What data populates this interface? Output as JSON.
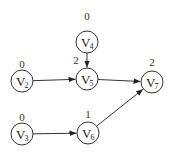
{
  "diagram": {
    "type": "directed-graph",
    "nodes": [
      {
        "id": "V2",
        "letter": "V",
        "sub": "2",
        "value": "0",
        "cx": 22,
        "cy": 81,
        "lx": 22,
        "ly": 68
      },
      {
        "id": "V3",
        "letter": "V",
        "sub": "3",
        "value": "0",
        "cx": 22,
        "cy": 134,
        "lx": 22,
        "ly": 121
      },
      {
        "id": "V4",
        "letter": "V",
        "sub": "4",
        "value": "0",
        "cx": 87,
        "cy": 42,
        "lx": 87,
        "ly": 20
      },
      {
        "id": "V5",
        "letter": "V",
        "sub": "5",
        "value": "2",
        "cx": 87,
        "cy": 79,
        "lx": 76,
        "ly": 64
      },
      {
        "id": "V6",
        "letter": "V",
        "sub": "6",
        "value": "1",
        "cx": 88,
        "cy": 133,
        "lx": 88,
        "ly": 118
      },
      {
        "id": "V7",
        "letter": "V",
        "sub": "7",
        "value": "2",
        "cx": 152,
        "cy": 82,
        "lx": 152,
        "ly": 66
      }
    ],
    "edges": [
      {
        "from": "V4",
        "to": "V5"
      },
      {
        "from": "V2",
        "to": "V5"
      },
      {
        "from": "V5",
        "to": "V7"
      },
      {
        "from": "V3",
        "to": "V6"
      },
      {
        "from": "V6",
        "to": "V7"
      }
    ]
  }
}
